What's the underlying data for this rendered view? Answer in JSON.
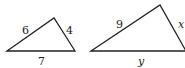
{
  "triangles": [
    {
      "name": "small-triangle",
      "sides": {
        "left": "6",
        "right": "4",
        "base": "7"
      }
    },
    {
      "name": "large-triangle",
      "sides": {
        "left": "9",
        "right": "x",
        "base": "y"
      }
    }
  ],
  "colors": {
    "stroke": "#222222",
    "background": "#ffffff"
  }
}
